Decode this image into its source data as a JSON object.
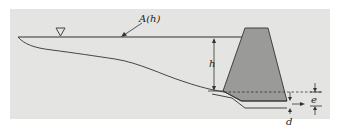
{
  "figure": {
    "labels": {
      "area": "A(h)",
      "height": "h",
      "e": "e",
      "d": "d"
    },
    "symbols": {
      "water_surface": "inverted-triangle-marker"
    },
    "colors": {
      "panel": "#e4e4e2",
      "dam_fill": "#9a9a98",
      "line": "#333333"
    }
  }
}
